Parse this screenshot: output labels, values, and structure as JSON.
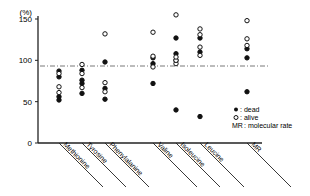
{
  "chart_data": {
    "type": "scatter",
    "title": "",
    "ylabel": "(%)",
    "xlabel": "",
    "ylim": [
      0,
      150
    ],
    "yticks": [
      0,
      50,
      100,
      150
    ],
    "reference_line": {
      "y": 100,
      "style": "dash-dot"
    },
    "grid": false,
    "categories": [
      "Methionine",
      "Tyrosine",
      "Phenylalanine",
      "Valine",
      "Isoleucine",
      "Leucine",
      "MR"
    ],
    "series": [
      {
        "name": "dead",
        "marker": "filled-circle",
        "values": [
          [
            52,
            56,
            80,
            87
          ],
          [
            60,
            72,
            76,
            88
          ],
          [
            53,
            66,
            98
          ],
          [
            72,
            96,
            103
          ],
          [
            40,
            100,
            108,
            127
          ],
          [
            32,
            110,
            127
          ],
          [
            62,
            103,
            114
          ]
        ]
      },
      {
        "name": "alive",
        "marker": "open-circle",
        "values": [
          [
            61,
            68,
            84
          ],
          [
            67,
            84,
            95
          ],
          [
            62,
            73,
            132
          ],
          [
            92,
            105,
            134
          ],
          [
            96,
            100,
            104,
            155
          ],
          [
            106,
            116,
            131,
            138
          ],
          [
            118,
            126,
            148
          ]
        ]
      }
    ],
    "legend": {
      "position": "lower-right",
      "entries": [
        {
          "symbol": "●",
          "label": ": dead"
        },
        {
          "symbol": "○",
          "label": ": alive"
        },
        {
          "symbol": "MR",
          "label": ": molecular rate"
        }
      ]
    }
  },
  "axis": {
    "unit_label": "(%)",
    "tick_labels": [
      "0",
      "50",
      "100",
      "150"
    ]
  }
}
